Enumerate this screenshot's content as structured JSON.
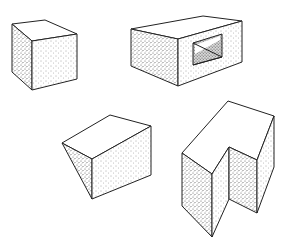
{
  "figure": {
    "background": "#ffffff",
    "stroke_color": "#222222",
    "shapes": [
      {
        "name": "rectangular-block",
        "position": "top-left"
      },
      {
        "name": "block-with-window",
        "position": "top-right"
      },
      {
        "name": "wedge-prism",
        "position": "bottom-left"
      },
      {
        "name": "notched-block",
        "position": "bottom-right"
      }
    ]
  }
}
